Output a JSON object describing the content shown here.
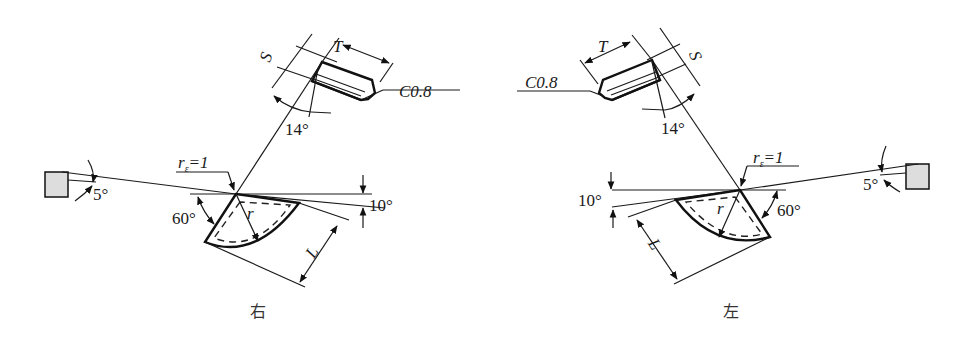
{
  "figures": [
    {
      "caption": "右",
      "labels": {
        "S": "S",
        "T": "T",
        "chamfer": "C0.8",
        "angle_14": "14°",
        "nose_radius": "r",
        "nose_radius_sub": "ε",
        "nose_radius_val": "=1",
        "angle_5": "5°",
        "angle_10": "10°",
        "angle_60": "60°",
        "r": "r",
        "L": "L"
      }
    },
    {
      "caption": "左",
      "labels": {
        "S": "S",
        "T": "T",
        "chamfer": "C0.8",
        "angle_14": "14°",
        "nose_radius": "r",
        "nose_radius_sub": "ε",
        "nose_radius_val": "=1",
        "angle_5": "5°",
        "angle_10": "10°",
        "angle_60": "60°",
        "r": "r",
        "L": "L"
      }
    }
  ]
}
